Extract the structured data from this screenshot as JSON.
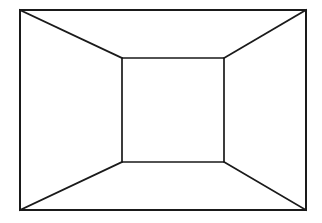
{
  "figure": {
    "background_color": "#ffffff",
    "line_color": "#1a1a1a",
    "canvas": {
      "width": 322,
      "height": 223
    }
  },
  "chart_data": {
    "type": "line",
    "xlabel": "",
    "ylabel": "",
    "xlim": [
      0,
      322
    ],
    "ylim": [
      0,
      223
    ],
    "grid": false,
    "legend": "none",
    "series": [
      {
        "name": "outer-rectangle",
        "closed": true,
        "stroke": "#1a1a1a",
        "stroke_width": 2,
        "x": [
          20,
          306,
          306,
          20
        ],
        "y": [
          10,
          10,
          210,
          210
        ]
      },
      {
        "name": "inner-rectangle",
        "closed": true,
        "stroke": "#1a1a1a",
        "stroke_width": 1.7,
        "x": [
          122,
          224,
          224,
          122
        ],
        "y": [
          58,
          58,
          162,
          162
        ]
      },
      {
        "name": "diagonal-top-left",
        "closed": false,
        "stroke": "#1a1a1a",
        "stroke_width": 1.7,
        "x": [
          20,
          122
        ],
        "y": [
          10,
          58
        ]
      },
      {
        "name": "diagonal-top-right",
        "closed": false,
        "stroke": "#1a1a1a",
        "stroke_width": 1.7,
        "x": [
          306,
          224
        ],
        "y": [
          10,
          58
        ]
      },
      {
        "name": "diagonal-bottom-right",
        "closed": false,
        "stroke": "#1a1a1a",
        "stroke_width": 1.7,
        "x": [
          306,
          224
        ],
        "y": [
          210,
          162
        ]
      },
      {
        "name": "diagonal-bottom-left",
        "closed": false,
        "stroke": "#1a1a1a",
        "stroke_width": 1.7,
        "x": [
          20,
          122
        ],
        "y": [
          210,
          162
        ]
      }
    ]
  },
  "geometry": {
    "outer_rectangle": {
      "label": "outer rectangle",
      "left": 20,
      "top": 10,
      "right": 306,
      "bottom": 210,
      "width": 286,
      "height": 200
    },
    "inner_rectangle": {
      "label": "inner rectangle",
      "left": 122,
      "top": 58,
      "right": 224,
      "bottom": 162,
      "width": 102,
      "height": 104
    },
    "diagonals": [
      {
        "label": "top-left diagonal",
        "x1": 20,
        "y1": 10,
        "x2": 122,
        "y2": 58
      },
      {
        "label": "top-right diagonal",
        "x1": 306,
        "y1": 10,
        "x2": 224,
        "y2": 58
      },
      {
        "label": "bottom-right diagonal",
        "x1": 306,
        "y1": 210,
        "x2": 224,
        "y2": 162
      },
      {
        "label": "bottom-left diagonal",
        "x1": 20,
        "y1": 210,
        "x2": 122,
        "y2": 162
      }
    ]
  }
}
